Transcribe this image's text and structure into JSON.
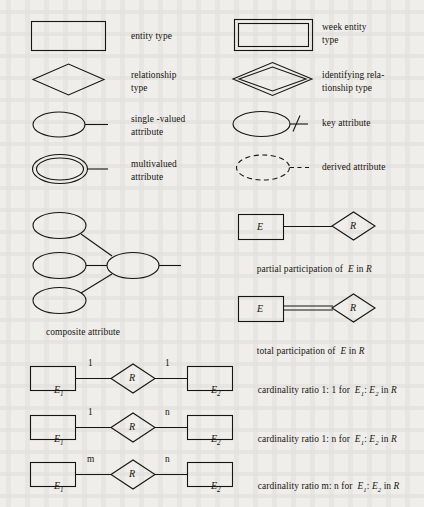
{
  "page": {
    "background_color": "#efeeea",
    "ink_color": "#17150f"
  },
  "legend": {
    "entity_type": {
      "label": "entity type",
      "symbol": "rectangle"
    },
    "weak_entity_type": {
      "label_line1": "week entity",
      "label_line2": "type",
      "symbol": "double-rectangle"
    },
    "relationship_type": {
      "label_line1": "relationship",
      "label_line2": "type",
      "symbol": "diamond"
    },
    "identifying_relationship_type": {
      "label_line1": "identifying rela-",
      "label_line2": "tionship type",
      "symbol": "double-diamond"
    },
    "single_valued_attribute": {
      "label_line1": "single -valued",
      "label_line2": "attribute",
      "symbol": "ellipse"
    },
    "key_attribute": {
      "label": "key attribute",
      "symbol": "ellipse-with-slash"
    },
    "multivalued_attribute": {
      "label_line1": "multivalued",
      "label_line2": "attribute",
      "symbol": "double-ellipse"
    },
    "derived_attribute": {
      "label": "derived attribute",
      "symbol": "dashed-ellipse"
    },
    "composite_attribute": {
      "label": "composite attribute",
      "symbol": "composite-ellipses"
    },
    "partial_participation": {
      "caption_part1": "partial participation of  ",
      "caption_entity": "E",
      "caption_part2": " in ",
      "caption_relationship": "R",
      "entity_label": "E",
      "relationship_label": "R",
      "line_style": "single"
    },
    "total_participation": {
      "caption_part1": "total participation of  ",
      "caption_entity": "E",
      "caption_part2": " in ",
      "caption_relationship": "R",
      "entity_label": "E",
      "relationship_label": "R",
      "line_style": "double"
    }
  },
  "cardinality_rows": [
    {
      "entity1_label": "E",
      "entity1_sub": "1",
      "relationship_label": "R",
      "entity2_label": "E",
      "entity2_sub": "2",
      "left_ratio": "1",
      "right_ratio": "1",
      "caption_prefix": "cardinality ratio 1: 1 for  ",
      "caption_e1": "E",
      "caption_e1_sub": "1",
      "caption_mid": ": ",
      "caption_e2": "E",
      "caption_e2_sub": "2",
      "caption_suffix": " in ",
      "caption_r": "R"
    },
    {
      "entity1_label": "E",
      "entity1_sub": "1",
      "relationship_label": "R",
      "entity2_label": "E",
      "entity2_sub": "2",
      "left_ratio": "1",
      "right_ratio": "n",
      "caption_prefix": "cardinality ratio 1: n for  ",
      "caption_e1": "E",
      "caption_e1_sub": "1",
      "caption_mid": ": ",
      "caption_e2": "E",
      "caption_e2_sub": "2",
      "caption_suffix": " in ",
      "caption_r": "R"
    },
    {
      "entity1_label": "E",
      "entity1_sub": "1",
      "relationship_label": "R",
      "entity2_label": "E",
      "entity2_sub": "2",
      "left_ratio": "m",
      "right_ratio": "n",
      "caption_prefix": "cardinality ratio m: n for  ",
      "caption_e1": "E",
      "caption_e1_sub": "1",
      "caption_mid": ": ",
      "caption_e2": "E",
      "caption_e2_sub": "2",
      "caption_suffix": " in ",
      "caption_r": "R"
    }
  ]
}
